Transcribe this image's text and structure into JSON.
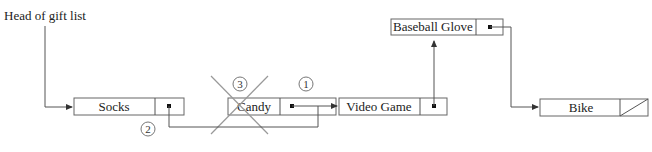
{
  "head_label": "Head of gift list",
  "nodes": [
    {
      "name": "Socks",
      "x": 74,
      "y": 100
    },
    {
      "name": "Candy",
      "x": 228,
      "y": 100,
      "deleted": true
    },
    {
      "name": "Video Game",
      "x": 339,
      "y": 100
    },
    {
      "name": "Baseball Glove",
      "x": 391,
      "y": 19
    },
    {
      "name": "Bike",
      "x": 540,
      "y": 100,
      "null_pointer": true
    }
  ],
  "step_markers": [
    "1",
    "2",
    "3"
  ],
  "colors": {
    "line": "#555555",
    "box": "#666666",
    "cross": "#999999"
  }
}
